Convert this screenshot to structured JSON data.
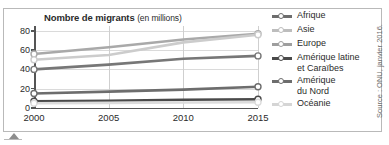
{
  "figure": {
    "title_main": "Nombre de migrants",
    "title_unit": "(en millions)",
    "source": "Source : ONU, janvier 2016."
  },
  "chart_data": {
    "type": "line",
    "title": "Nombre de migrants (en millions)",
    "xlabel": "",
    "ylabel": "",
    "unit": "millions",
    "grid": true,
    "legend_position": "right",
    "x": [
      2000,
      2005,
      2010,
      2015
    ],
    "xtick_labels": [
      "2000",
      "2005",
      "2010",
      "2015"
    ],
    "xlim": [
      2000,
      2015
    ],
    "ylim": [
      0,
      85
    ],
    "ytick_labels": [
      "0",
      "20",
      "40",
      "60",
      "80"
    ],
    "yticks": [
      0,
      20,
      40,
      60,
      80
    ],
    "series": [
      {
        "name": "Afrique",
        "values": [
          15,
          17,
          19,
          22
        ],
        "color": "#6d6d6d"
      },
      {
        "name": "Asie",
        "values": [
          56,
          63,
          71,
          77
        ],
        "color": "#a9a9a9"
      },
      {
        "name": "Europe",
        "values": [
          50,
          55,
          68,
          76
        ],
        "color": "#cccccc"
      },
      {
        "name": "Amérique latine\net Caraïbes",
        "values": [
          7,
          7.5,
          8.5,
          9
        ],
        "color": "#4a4a4a"
      },
      {
        "name": "Amérique\ndu Nord",
        "values": [
          40,
          45,
          51,
          54
        ],
        "color": "#777777"
      },
      {
        "name": "Océanie",
        "values": [
          5,
          5.3,
          5.7,
          6
        ],
        "color": "#dcdcdc"
      }
    ]
  },
  "legend": {
    "items": [
      {
        "label": "Afrique",
        "color": "#6d6d6d"
      },
      {
        "label": "Asie",
        "color": "#bdbdbd"
      },
      {
        "label": "Europe",
        "color": "#9e9e9e"
      },
      {
        "label": "Amérique latine\net Caraïbes",
        "color": "#4a4a4a"
      },
      {
        "label": "Amérique\ndu Nord",
        "color": "#6d6d6d"
      },
      {
        "label": "Océanie",
        "color": "#d5d5d5"
      }
    ]
  }
}
